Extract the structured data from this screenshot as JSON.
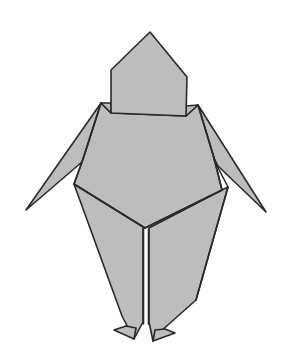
{
  "diagram": {
    "colors": {
      "paper": "#bdbdbd",
      "outline": "#2a2a2a",
      "background": "#ffffff"
    },
    "parts": [
      "head",
      "shoulders",
      "body",
      "left-arm",
      "right-arm",
      "left-leg",
      "right-leg",
      "left-foot",
      "right-foot"
    ]
  }
}
